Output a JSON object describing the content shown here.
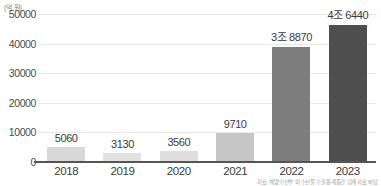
{
  "unit_label": "(억 원)",
  "source_note": "자료: 해양수산부 외 수산물 수출통계중간 집계 자료 바탕",
  "colors": {
    "axis": "#555555",
    "gridline": "#e9e9e9",
    "tick_text": "#4a4a4a",
    "value_text": "#3a3a3a",
    "unit_text": "#8b8b8b",
    "source_text": "#a0a0a0"
  },
  "chart_data": {
    "type": "bar",
    "title": "",
    "xlabel": "",
    "ylabel": "(억 원)",
    "ylim": [
      0,
      50000
    ],
    "yticks": [
      0,
      10000,
      20000,
      30000,
      40000,
      50000
    ],
    "ytick_labels": [
      "0",
      "10000",
      "20000",
      "30000",
      "40000",
      "50000"
    ],
    "grid": true,
    "legend": "none",
    "categories": [
      "2018",
      "2019",
      "2020",
      "2021",
      "2022",
      "2023"
    ],
    "values": [
      5060,
      3130,
      3560,
      9710,
      38870,
      46440
    ],
    "data_labels": [
      "5060",
      "3130",
      "3560",
      "9710",
      "3조 8870",
      "4조 6440"
    ],
    "bar_colors": [
      "#d8d8d8",
      "#e2e2e2",
      "#dedede",
      "#c6c6c6",
      "#7d7d7d",
      "#4e4e4e"
    ]
  }
}
